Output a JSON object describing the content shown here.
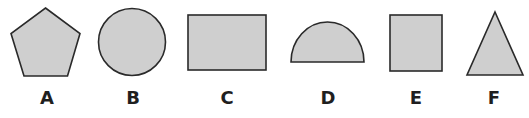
{
  "figure": {
    "shapes": [
      {
        "label": "A",
        "name": "pentagon"
      },
      {
        "label": "B",
        "name": "circle"
      },
      {
        "label": "C",
        "name": "rectangle"
      },
      {
        "label": "D",
        "name": "semicircle"
      },
      {
        "label": "E",
        "name": "square"
      },
      {
        "label": "F",
        "name": "triangle"
      }
    ],
    "colors": {
      "fill": "#cfcfcf",
      "stroke": "#2a2a2a",
      "label": "#1f1f1f",
      "background": "#ffffff"
    }
  }
}
